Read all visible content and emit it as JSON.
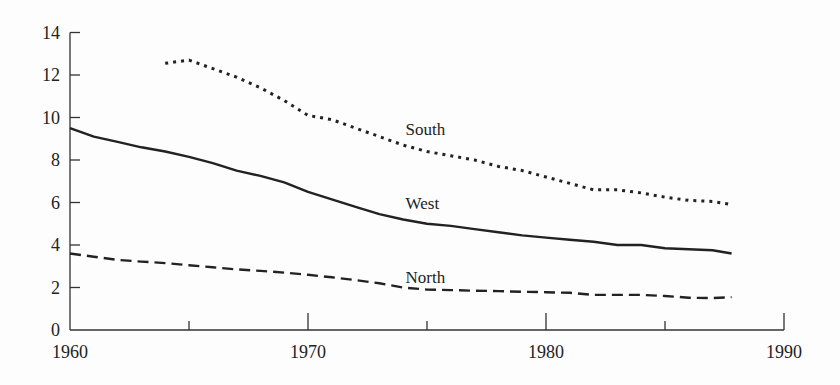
{
  "chart_data": {
    "type": "line",
    "title": "",
    "xlabel": "",
    "ylabel": "",
    "xlim": [
      1960,
      1990
    ],
    "ylim": [
      0,
      14
    ],
    "grid": false,
    "legend": "inline labels",
    "x_ticks": [
      1960,
      1970,
      1980,
      1990
    ],
    "x_minor_ticks": [
      1965,
      1975,
      1985
    ],
    "y_ticks": [
      0,
      2,
      4,
      6,
      8,
      10,
      12,
      14
    ],
    "x_tick_labels": [
      "1960",
      "1970",
      "1980",
      "1990"
    ],
    "y_tick_labels": [
      "0",
      "2",
      "4",
      "6",
      "8",
      "10",
      "12",
      "14"
    ],
    "series": [
      {
        "name": "South",
        "style": "dotted",
        "label_pos": [
          1974.1,
          9.2
        ],
        "x": [
          1964,
          1965,
          1966,
          1967,
          1968,
          1969,
          1970,
          1971,
          1972,
          1973,
          1974,
          1975,
          1976,
          1977,
          1978,
          1979,
          1980,
          1981,
          1982,
          1983,
          1984,
          1985,
          1986,
          1987,
          1987.8
        ],
        "values": [
          12.55,
          12.7,
          12.3,
          11.9,
          11.4,
          10.8,
          10.1,
          9.9,
          9.5,
          9.1,
          8.7,
          8.4,
          8.2,
          8.0,
          7.7,
          7.5,
          7.2,
          6.9,
          6.6,
          6.6,
          6.45,
          6.25,
          6.1,
          6.05,
          5.9
        ]
      },
      {
        "name": "West",
        "style": "solid",
        "label_pos": [
          1974.1,
          5.7
        ],
        "x": [
          1960,
          1961,
          1962,
          1963,
          1964,
          1965,
          1966,
          1967,
          1968,
          1969,
          1970,
          1971,
          1972,
          1973,
          1974,
          1975,
          1976,
          1977,
          1978,
          1979,
          1980,
          1981,
          1982,
          1983,
          1984,
          1985,
          1986,
          1987,
          1987.8
        ],
        "values": [
          9.5,
          9.1,
          8.85,
          8.6,
          8.4,
          8.15,
          7.85,
          7.5,
          7.25,
          6.95,
          6.5,
          6.15,
          5.8,
          5.45,
          5.2,
          5.0,
          4.9,
          4.75,
          4.6,
          4.45,
          4.35,
          4.25,
          4.15,
          4.0,
          4.0,
          3.85,
          3.8,
          3.75,
          3.6
        ]
      },
      {
        "name": "North",
        "style": "dashed",
        "label_pos": [
          1974.1,
          2.2
        ],
        "x": [
          1960,
          1961,
          1962,
          1963,
          1964,
          1965,
          1966,
          1967,
          1968,
          1969,
          1970,
          1971,
          1972,
          1973,
          1974,
          1975,
          1976,
          1977,
          1978,
          1979,
          1980,
          1981,
          1982,
          1983,
          1984,
          1985,
          1986,
          1987,
          1987.8
        ],
        "values": [
          3.6,
          3.45,
          3.3,
          3.22,
          3.15,
          3.05,
          2.95,
          2.85,
          2.78,
          2.7,
          2.6,
          2.48,
          2.35,
          2.2,
          2.0,
          1.9,
          1.88,
          1.85,
          1.83,
          1.8,
          1.78,
          1.75,
          1.65,
          1.65,
          1.65,
          1.6,
          1.52,
          1.5,
          1.55
        ]
      }
    ]
  },
  "colors": {
    "line": "#222222",
    "axis": "#333333",
    "background": "#fdfdfd"
  }
}
